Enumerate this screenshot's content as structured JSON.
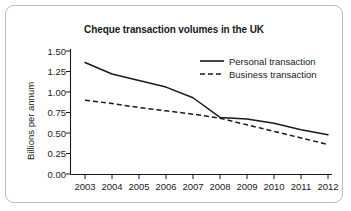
{
  "figure": {
    "border_color": "#bdbdbd",
    "background": "#ffffff"
  },
  "chart_data": {
    "type": "line",
    "title": "Cheque transaction volumes in the UK",
    "xlabel": "",
    "ylabel": "Billions per annum",
    "categories": [
      "2003",
      "2004",
      "2005",
      "2006",
      "2007",
      "2008",
      "2009",
      "2010",
      "2011",
      "2012"
    ],
    "x": [
      2003,
      2004,
      2005,
      2006,
      2007,
      2008,
      2009,
      2010,
      2011,
      2012
    ],
    "series": [
      {
        "name": "Personal transaction",
        "style": "solid",
        "color": "#1a1a1a",
        "values": [
          1.36,
          1.22,
          1.14,
          1.06,
          0.93,
          0.69,
          0.67,
          0.62,
          0.54,
          0.48
        ]
      },
      {
        "name": "Business transaction",
        "style": "dashed",
        "color": "#1a1a1a",
        "values": [
          0.9,
          0.86,
          0.81,
          0.77,
          0.73,
          0.68,
          0.6,
          0.52,
          0.44,
          0.36
        ]
      }
    ],
    "ylim": [
      0.0,
      1.5
    ],
    "yticks": [
      0.0,
      0.25,
      0.5,
      0.75,
      1.0,
      1.25,
      1.5
    ],
    "ytick_labels": [
      "0.00",
      "0.25",
      "0.50",
      "0.75",
      "1.00",
      "1.25",
      "1.50"
    ],
    "grid": false,
    "legend_position": "top-right"
  },
  "axis": {
    "y_title": "Billions per annum"
  },
  "legend": {
    "items": [
      {
        "label": "Personal transaction",
        "style": "solid"
      },
      {
        "label": "Business transaction",
        "style": "dashed"
      }
    ]
  }
}
